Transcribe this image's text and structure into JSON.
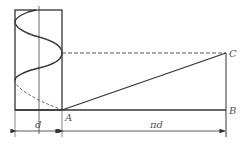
{
  "diagram": {
    "labels": {
      "A": "A",
      "B": "B",
      "C": "C",
      "d": "d",
      "pi_d": "πd"
    },
    "colors": {
      "stroke": "#333333",
      "background": "#ffffff"
    }
  }
}
